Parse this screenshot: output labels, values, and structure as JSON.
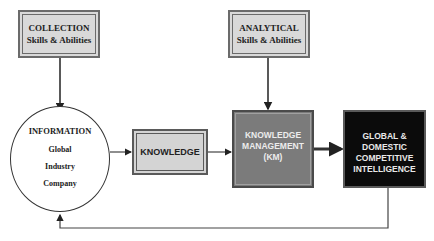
{
  "diagram": {
    "type": "flowchart",
    "nodes": {
      "collection": {
        "title": "COLLECTION",
        "subtitle": "Skills & Abilities"
      },
      "analytical": {
        "title": "ANALYTICAL",
        "subtitle": "Skills & Abilities"
      },
      "information": {
        "title": "INFORMATION",
        "items": [
          "Global",
          "Industry",
          "Company"
        ]
      },
      "knowledge": {
        "title": "KNOWLEDGE"
      },
      "km": {
        "lines": [
          "KNOWLEDGE",
          "MANAGEMENT",
          "(KM)"
        ]
      },
      "gci": {
        "lines": [
          "GLOBAL &",
          "DOMESTIC",
          "COMPETITIVE",
          "INTELLIGENCE"
        ]
      }
    },
    "edges": [
      {
        "from": "collection",
        "to": "information"
      },
      {
        "from": "information",
        "to": "knowledge"
      },
      {
        "from": "knowledge",
        "to": "km"
      },
      {
        "from": "analytical",
        "to": "km"
      },
      {
        "from": "km",
        "to": "gci"
      },
      {
        "from": "gci",
        "to": "information",
        "label": "feedback loop"
      }
    ],
    "colors": {
      "skill_box_fill": "#d9d9d9",
      "knowledge_fill": "#d4d4d4",
      "km_fill": "#7b7b7b",
      "gci_fill": "#0b0b0b",
      "line": "#333333"
    }
  }
}
